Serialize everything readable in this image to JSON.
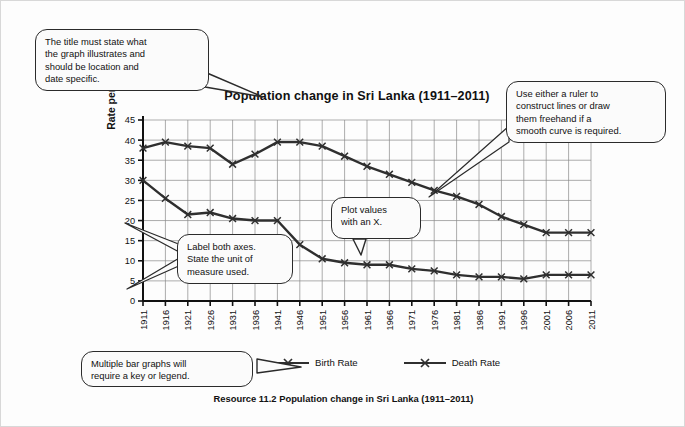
{
  "chart_title": "Population change in Sri Lanka (1911–2011)",
  "caption": "Resource 11.2 Population change in Sri Lanka  (1911–2011)",
  "y_axis_label": "Rate per 1000",
  "callouts": {
    "title_note": {
      "lines": [
        "The title must state what",
        "the graph illustrates and",
        "should be location and",
        "date specific."
      ]
    },
    "ruler_note": {
      "lines": [
        "Use either a ruler to",
        "construct lines or draw",
        "them freehand if a",
        "smooth curve is required."
      ]
    },
    "plot_note": {
      "lines": [
        "Plot values",
        "with an X."
      ]
    },
    "axes_note": {
      "lines": [
        "Label both axes.",
        "State the unit of",
        "measure used."
      ]
    },
    "legend_note": {
      "lines": [
        "Multiple bar graphs will",
        "require a key or legend."
      ]
    }
  },
  "legend": {
    "items": [
      {
        "label": "Birth Rate",
        "color": "#2f2f2f"
      },
      {
        "label": "Death Rate",
        "color": "#2f2f2f"
      }
    ]
  },
  "chart_data": {
    "type": "line",
    "title": "Population change in Sri Lanka (1911–2011)",
    "xlabel": "",
    "ylabel": "Rate per 1000",
    "ylim": [
      0,
      45
    ],
    "yticks": [
      0,
      5,
      10,
      15,
      20,
      25,
      30,
      35,
      40,
      45
    ],
    "grid": true,
    "legend_position": "below-plot",
    "marker": "x",
    "categories": [
      "1911",
      "1916",
      "1921",
      "1926",
      "1931",
      "1936",
      "1941",
      "1946",
      "1951",
      "1956",
      "1961",
      "1966",
      "1971",
      "1976",
      "1981",
      "1986",
      "1991",
      "1996",
      "2001",
      "2006",
      "2011"
    ],
    "series": [
      {
        "name": "Birth Rate",
        "color": "#2f2f2f",
        "values": [
          38,
          39.5,
          38.5,
          38,
          34,
          36.5,
          39.5,
          39.5,
          38.5,
          36,
          33.5,
          31.5,
          29.5,
          27.5,
          26,
          24,
          21,
          19,
          17,
          17,
          17
        ]
      },
      {
        "name": "Death Rate",
        "color": "#2f2f2f",
        "values": [
          30,
          25.5,
          21.5,
          22,
          20.5,
          20,
          20,
          14,
          10.5,
          9.5,
          9,
          9,
          8,
          7.5,
          6.5,
          6,
          6,
          5.5,
          6.5,
          6.5,
          6.5
        ]
      }
    ]
  }
}
